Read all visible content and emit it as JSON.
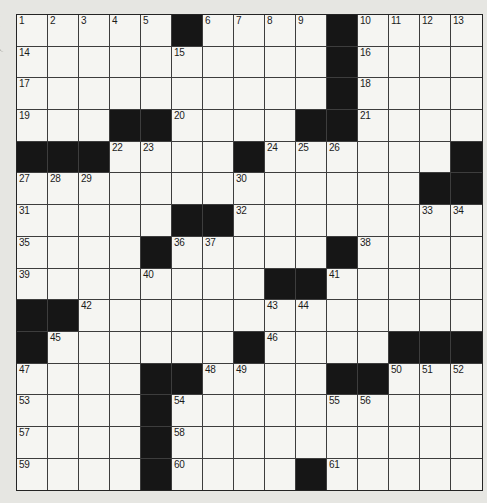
{
  "puzzle": {
    "kind": "crossword-grid",
    "size": {
      "rows": 15,
      "cols": 15
    },
    "rows": [
      ".....#....#....",
      "..........#....",
      "..........#....",
      "...##....##....",
      "###....#......#",
      ".............##",
      ".....##........",
      "....#.....#....",
      "........##.....",
      "##.............",
      "#......#....###",
      "....##....##...",
      "....#..........",
      "....#..........",
      "....#....#....."
    ],
    "numbered_cells": [
      {
        "num": 1,
        "row": 1,
        "col": 1
      },
      {
        "num": 2,
        "row": 1,
        "col": 2
      },
      {
        "num": 3,
        "row": 1,
        "col": 3
      },
      {
        "num": 4,
        "row": 1,
        "col": 4
      },
      {
        "num": 5,
        "row": 1,
        "col": 5
      },
      {
        "num": 6,
        "row": 1,
        "col": 7
      },
      {
        "num": 7,
        "row": 1,
        "col": 8
      },
      {
        "num": 8,
        "row": 1,
        "col": 9
      },
      {
        "num": 9,
        "row": 1,
        "col": 10
      },
      {
        "num": 10,
        "row": 1,
        "col": 12
      },
      {
        "num": 11,
        "row": 1,
        "col": 13
      },
      {
        "num": 12,
        "row": 1,
        "col": 14
      },
      {
        "num": 13,
        "row": 1,
        "col": 15
      },
      {
        "num": 14,
        "row": 2,
        "col": 1
      },
      {
        "num": 15,
        "row": 2,
        "col": 6
      },
      {
        "num": 16,
        "row": 2,
        "col": 12
      },
      {
        "num": 17,
        "row": 3,
        "col": 1
      },
      {
        "num": 18,
        "row": 3,
        "col": 12
      },
      {
        "num": 19,
        "row": 4,
        "col": 1
      },
      {
        "num": 20,
        "row": 4,
        "col": 6
      },
      {
        "num": 21,
        "row": 4,
        "col": 12
      },
      {
        "num": 22,
        "row": 5,
        "col": 4
      },
      {
        "num": 23,
        "row": 5,
        "col": 5
      },
      {
        "num": 24,
        "row": 5,
        "col": 9
      },
      {
        "num": 25,
        "row": 5,
        "col": 10
      },
      {
        "num": 26,
        "row": 5,
        "col": 11
      },
      {
        "num": 27,
        "row": 6,
        "col": 1
      },
      {
        "num": 28,
        "row": 6,
        "col": 2
      },
      {
        "num": 29,
        "row": 6,
        "col": 3
      },
      {
        "num": 30,
        "row": 6,
        "col": 8
      },
      {
        "num": 31,
        "row": 7,
        "col": 1
      },
      {
        "num": 32,
        "row": 7,
        "col": 8
      },
      {
        "num": 33,
        "row": 7,
        "col": 14
      },
      {
        "num": 34,
        "row": 7,
        "col": 15
      },
      {
        "num": 35,
        "row": 8,
        "col": 1
      },
      {
        "num": 36,
        "row": 8,
        "col": 6
      },
      {
        "num": 37,
        "row": 8,
        "col": 7
      },
      {
        "num": 38,
        "row": 8,
        "col": 12
      },
      {
        "num": 39,
        "row": 9,
        "col": 1
      },
      {
        "num": 40,
        "row": 9,
        "col": 5
      },
      {
        "num": 41,
        "row": 9,
        "col": 11
      },
      {
        "num": 42,
        "row": 10,
        "col": 3
      },
      {
        "num": 43,
        "row": 10,
        "col": 9
      },
      {
        "num": 44,
        "row": 10,
        "col": 10
      },
      {
        "num": 45,
        "row": 11,
        "col": 2
      },
      {
        "num": 46,
        "row": 11,
        "col": 9
      },
      {
        "num": 47,
        "row": 12,
        "col": 1
      },
      {
        "num": 48,
        "row": 12,
        "col": 7
      },
      {
        "num": 49,
        "row": 12,
        "col": 8
      },
      {
        "num": 50,
        "row": 12,
        "col": 13
      },
      {
        "num": 51,
        "row": 12,
        "col": 14
      },
      {
        "num": 52,
        "row": 12,
        "col": 15
      },
      {
        "num": 53,
        "row": 13,
        "col": 1
      },
      {
        "num": 54,
        "row": 13,
        "col": 6
      },
      {
        "num": 55,
        "row": 13,
        "col": 11
      },
      {
        "num": 56,
        "row": 13,
        "col": 12
      },
      {
        "num": 57,
        "row": 14,
        "col": 1
      },
      {
        "num": 58,
        "row": 14,
        "col": 6
      },
      {
        "num": 59,
        "row": 15,
        "col": 1
      },
      {
        "num": 60,
        "row": 15,
        "col": 6
      },
      {
        "num": 61,
        "row": 15,
        "col": 11
      }
    ]
  },
  "colors": {
    "page_background": "#e6e6e2",
    "cell_white": "#f5f5f2",
    "cell_black": "#161616",
    "grid_line": "#3d3d3d",
    "outer_border": "#242424",
    "number_text": "#1b1b1b"
  }
}
